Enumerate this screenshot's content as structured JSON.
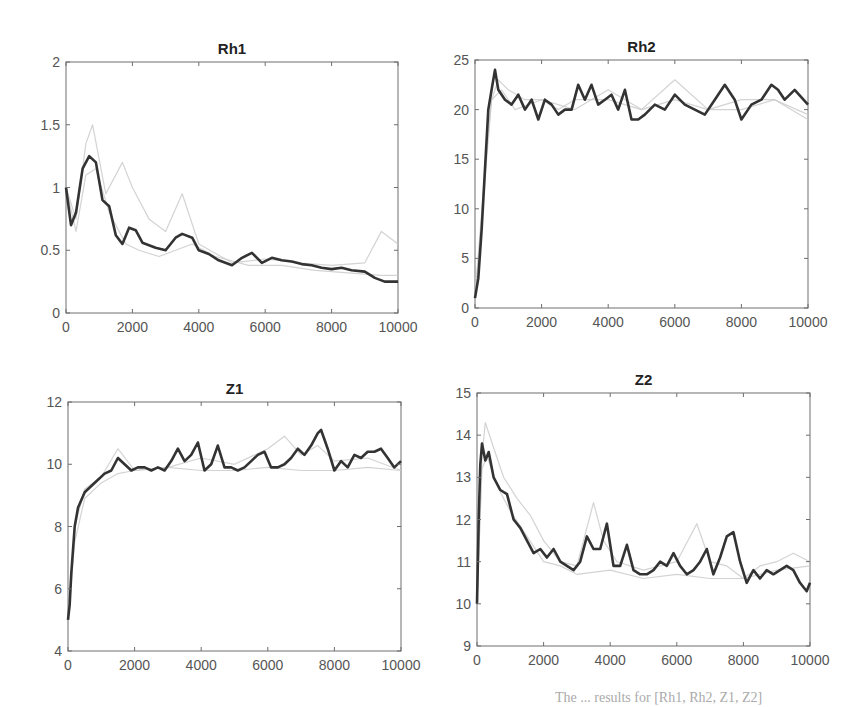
{
  "figure": {
    "caption_fragment": "The  ...  results for  [Rh1, Rh2, Z1, Z2]"
  },
  "colors": {
    "main_series": "#333333",
    "ghost_series": "#c8c8c8",
    "axis": "#6e6e6e",
    "tick_text": "#555555",
    "title_text": "#222222"
  },
  "chart_data": [
    {
      "type": "line",
      "title": "Rh1",
      "xlabel": "",
      "ylabel": "",
      "xlim": [
        0,
        10000
      ],
      "ylim": [
        0,
        2
      ],
      "xticks": [
        0,
        2000,
        4000,
        6000,
        8000,
        10000
      ],
      "yticks": [
        0,
        0.5,
        1,
        1.5,
        2
      ],
      "ytick_labels": [
        "0",
        "0.5",
        "1",
        "1.5",
        "2"
      ],
      "grid": false,
      "series": [
        {
          "name": "main",
          "style": "dark",
          "x": [
            0,
            150,
            300,
            500,
            700,
            900,
            1100,
            1300,
            1500,
            1700,
            1900,
            2100,
            2300,
            2500,
            2700,
            3000,
            3300,
            3500,
            3800,
            4000,
            4300,
            4600,
            5000,
            5300,
            5600,
            5900,
            6200,
            6500,
            6800,
            7100,
            7400,
            7700,
            8000,
            8300,
            8600,
            9000,
            9300,
            9600,
            10000
          ],
          "y": [
            1.0,
            0.7,
            0.8,
            1.15,
            1.25,
            1.2,
            0.9,
            0.85,
            0.62,
            0.55,
            0.68,
            0.66,
            0.56,
            0.54,
            0.52,
            0.5,
            0.6,
            0.63,
            0.6,
            0.5,
            0.47,
            0.42,
            0.38,
            0.44,
            0.48,
            0.4,
            0.44,
            0.42,
            0.41,
            0.39,
            0.38,
            0.36,
            0.35,
            0.36,
            0.34,
            0.33,
            0.28,
            0.25,
            0.25
          ]
        },
        {
          "name": "ghost-1",
          "style": "light",
          "x": [
            0,
            300,
            600,
            800,
            1200,
            1700,
            2000,
            2500,
            3000,
            3500,
            4000,
            5000,
            6000,
            7000,
            8000,
            9000,
            9500,
            10000
          ],
          "y": [
            1.0,
            0.75,
            1.35,
            1.5,
            0.95,
            1.2,
            1.0,
            0.75,
            0.65,
            0.95,
            0.55,
            0.4,
            0.43,
            0.4,
            0.38,
            0.4,
            0.65,
            0.55
          ]
        },
        {
          "name": "ghost-2",
          "style": "light",
          "x": [
            0,
            300,
            600,
            900,
            1300,
            1800,
            2200,
            2800,
            3300,
            3800,
            4500,
            5500,
            6500,
            7500,
            8500,
            9500,
            10000
          ],
          "y": [
            1.0,
            0.65,
            1.1,
            1.15,
            0.8,
            0.55,
            0.5,
            0.45,
            0.5,
            0.55,
            0.45,
            0.38,
            0.38,
            0.34,
            0.32,
            0.3,
            0.3
          ]
        }
      ]
    },
    {
      "type": "line",
      "title": "Rh2",
      "xlabel": "",
      "ylabel": "",
      "xlim": [
        0,
        10000
      ],
      "ylim": [
        0,
        25
      ],
      "xticks": [
        0,
        2000,
        4000,
        6000,
        8000,
        10000
      ],
      "yticks": [
        0,
        5,
        10,
        15,
        20,
        25
      ],
      "ytick_labels": [
        "0",
        "5",
        "10",
        "15",
        "20",
        "25"
      ],
      "grid": false,
      "series": [
        {
          "name": "main",
          "style": "dark",
          "x": [
            0,
            100,
            200,
            300,
            400,
            500,
            600,
            700,
            900,
            1100,
            1300,
            1500,
            1700,
            1900,
            2100,
            2300,
            2500,
            2700,
            2900,
            3100,
            3300,
            3500,
            3700,
            3900,
            4100,
            4300,
            4500,
            4700,
            4900,
            5100,
            5400,
            5700,
            6000,
            6300,
            6600,
            6900,
            7200,
            7500,
            7800,
            8000,
            8300,
            8600,
            8900,
            9100,
            9300,
            9600,
            10000
          ],
          "y": [
            1,
            3,
            8,
            14,
            20,
            22,
            24,
            22,
            21,
            20.5,
            21.5,
            20,
            21,
            19,
            21,
            20.5,
            19.5,
            20,
            20,
            22.5,
            21,
            22.5,
            20.5,
            21,
            21.5,
            20,
            22,
            19,
            19,
            19.5,
            20.5,
            20,
            21.5,
            20.5,
            20,
            19.5,
            21,
            22.5,
            21,
            19,
            20.5,
            21,
            22.5,
            22,
            21,
            22,
            20.5
          ]
        },
        {
          "name": "ghost-1",
          "style": "light",
          "x": [
            0,
            300,
            500,
            700,
            1000,
            1500,
            2000,
            2500,
            3000,
            4000,
            5000,
            6000,
            7000,
            8000,
            9000,
            10000
          ],
          "y": [
            1,
            14,
            21,
            23,
            22,
            21,
            21,
            20,
            21,
            21,
            20,
            23,
            20,
            20,
            21,
            19
          ]
        },
        {
          "name": "ghost-2",
          "style": "light",
          "x": [
            0,
            300,
            500,
            800,
            1200,
            2000,
            3000,
            4000,
            5000,
            6000,
            7000,
            8000,
            9000,
            10000
          ],
          "y": [
            1,
            13,
            21,
            22,
            20,
            21,
            20,
            22,
            20,
            21,
            20,
            21,
            21,
            19.5
          ]
        }
      ]
    },
    {
      "type": "line",
      "title": "Z1",
      "xlabel": "",
      "ylabel": "",
      "xlim": [
        0,
        10000
      ],
      "ylim": [
        4,
        12
      ],
      "xticks": [
        0,
        2000,
        4000,
        6000,
        8000,
        10000
      ],
      "yticks": [
        4,
        6,
        8,
        10,
        12
      ],
      "ytick_labels": [
        "4",
        "6",
        "8",
        "10",
        "12"
      ],
      "grid": false,
      "series": [
        {
          "name": "main",
          "style": "dark",
          "x": [
            0,
            50,
            100,
            200,
            300,
            500,
            700,
            900,
            1100,
            1300,
            1500,
            1700,
            1900,
            2100,
            2300,
            2500,
            2700,
            2900,
            3100,
            3300,
            3500,
            3700,
            3900,
            4100,
            4300,
            4500,
            4700,
            4900,
            5100,
            5300,
            5500,
            5700,
            5900,
            6100,
            6300,
            6500,
            6700,
            6900,
            7100,
            7300,
            7500,
            7600,
            7800,
            8000,
            8200,
            8400,
            8600,
            8800,
            9000,
            9200,
            9400,
            9600,
            9800,
            10000
          ],
          "y": [
            5,
            5.5,
            6.5,
            8,
            8.6,
            9.1,
            9.3,
            9.5,
            9.7,
            9.8,
            10.2,
            10.0,
            9.8,
            9.9,
            9.9,
            9.8,
            9.9,
            9.8,
            10.1,
            10.5,
            10.1,
            10.3,
            10.7,
            9.8,
            10.0,
            10.6,
            9.9,
            9.9,
            9.8,
            9.9,
            10.1,
            10.3,
            10.4,
            9.9,
            9.9,
            10.0,
            10.2,
            10.5,
            10.3,
            10.6,
            11.0,
            11.1,
            10.5,
            9.8,
            10.1,
            9.9,
            10.3,
            10.2,
            10.4,
            10.4,
            10.5,
            10.2,
            9.9,
            10.1
          ]
        },
        {
          "name": "ghost-1",
          "style": "light",
          "x": [
            0,
            200,
            500,
            1000,
            1500,
            2000,
            3000,
            4000,
            5000,
            6000,
            6500,
            7000,
            7500,
            8000,
            9000,
            10000
          ],
          "y": [
            5,
            8,
            9.2,
            9.6,
            10.5,
            9.8,
            9.9,
            10.2,
            10.0,
            10.5,
            10.9,
            10.3,
            10.6,
            10.1,
            10.2,
            9.8
          ]
        },
        {
          "name": "ghost-2",
          "style": "light",
          "x": [
            0,
            200,
            500,
            1000,
            1500,
            2000,
            3000,
            4000,
            5000,
            6000,
            7000,
            8000,
            9000,
            10000
          ],
          "y": [
            5,
            7.5,
            8.9,
            9.4,
            9.7,
            9.8,
            9.9,
            9.8,
            9.8,
            9.9,
            9.8,
            9.8,
            9.9,
            9.8
          ]
        }
      ]
    },
    {
      "type": "line",
      "title": "Z2",
      "xlabel": "",
      "ylabel": "",
      "xlim": [
        0,
        10000
      ],
      "ylim": [
        9,
        15
      ],
      "xticks": [
        0,
        2000,
        4000,
        6000,
        8000,
        10000
      ],
      "yticks": [
        9,
        10,
        11,
        12,
        13,
        14,
        15
      ],
      "ytick_labels": [
        "9",
        "10",
        "11",
        "12",
        "13",
        "14",
        "15"
      ],
      "grid": false,
      "series": [
        {
          "name": "main",
          "style": "dark",
          "x": [
            0,
            50,
            100,
            150,
            250,
            350,
            500,
            700,
            900,
            1100,
            1300,
            1500,
            1700,
            1900,
            2100,
            2300,
            2500,
            2700,
            2900,
            3100,
            3300,
            3500,
            3700,
            3900,
            4100,
            4300,
            4500,
            4700,
            4900,
            5100,
            5300,
            5500,
            5700,
            5900,
            6100,
            6300,
            6500,
            6700,
            6900,
            7100,
            7300,
            7500,
            7700,
            7900,
            8100,
            8300,
            8500,
            8700,
            8900,
            9100,
            9300,
            9500,
            9700,
            9900,
            10000
          ],
          "y": [
            10,
            12,
            13.3,
            13.8,
            13.4,
            13.6,
            13.0,
            12.7,
            12.6,
            12.0,
            11.8,
            11.5,
            11.2,
            11.3,
            11.1,
            11.3,
            11.0,
            10.9,
            10.8,
            11.0,
            11.6,
            11.3,
            11.3,
            11.9,
            10.9,
            10.9,
            11.4,
            10.8,
            10.7,
            10.7,
            10.8,
            11.0,
            10.9,
            11.2,
            10.9,
            10.7,
            10.8,
            11.0,
            11.3,
            10.7,
            11.1,
            11.6,
            11.7,
            11.0,
            10.5,
            10.8,
            10.6,
            10.8,
            10.7,
            10.8,
            10.9,
            10.8,
            10.5,
            10.3,
            10.5
          ]
        },
        {
          "name": "ghost-1",
          "style": "light",
          "x": [
            0,
            150,
            250,
            500,
            800,
            1200,
            1600,
            2000,
            2500,
            3000,
            3500,
            3800,
            4200,
            5000,
            6000,
            6600,
            7000,
            7500,
            8000,
            8500,
            9000,
            9500,
            10000
          ],
          "y": [
            10,
            13.5,
            14.3,
            13.7,
            13.0,
            12.5,
            12.1,
            11.5,
            11.0,
            10.9,
            12.4,
            11.5,
            11.0,
            10.8,
            11.0,
            11.9,
            11.0,
            10.9,
            10.6,
            10.9,
            11.0,
            11.2,
            11.0
          ]
        },
        {
          "name": "ghost-2",
          "style": "light",
          "x": [
            0,
            150,
            300,
            600,
            1000,
            1500,
            2000,
            2500,
            3000,
            4000,
            5000,
            6000,
            7000,
            8000,
            9000,
            10000
          ],
          "y": [
            10,
            13.2,
            13.5,
            12.8,
            12.2,
            11.6,
            11.0,
            10.9,
            10.7,
            10.8,
            10.6,
            10.7,
            10.6,
            10.6,
            10.8,
            10.9
          ]
        }
      ]
    }
  ]
}
